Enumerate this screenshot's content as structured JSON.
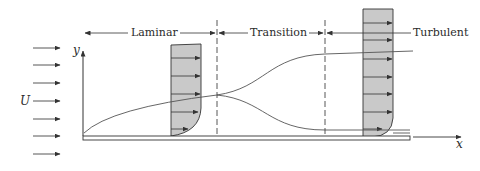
{
  "diagram": {
    "regions": [
      {
        "label": "Laminar"
      },
      {
        "label": "Transition"
      },
      {
        "label": "Turbulent"
      }
    ],
    "freestream_label": "U",
    "axes": {
      "x_label": "x",
      "y_label": "y"
    },
    "colors": {
      "line": "#333333",
      "profile_fill": "#c9c9c9",
      "background": "#ffffff"
    }
  }
}
